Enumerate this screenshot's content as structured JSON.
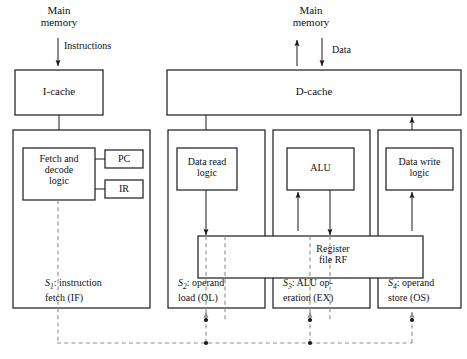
{
  "figure": {
    "type": "block-diagram"
  },
  "memory_ports": {
    "instruction_side": {
      "label": "Main\nmemory",
      "bus_label": "Instructions",
      "direction": "down"
    },
    "data_side": {
      "label": "Main\nmemory",
      "bus_label": "Data",
      "direction": "bidirectional"
    }
  },
  "caches": {
    "icache": "I-cache",
    "dcache": "D-cache"
  },
  "units": {
    "fetch_decode": "Fetch and\ndecode\nlogic",
    "pc": "PC",
    "ir": "IR",
    "data_read": "Data read\nlogic",
    "alu": "ALU",
    "data_write": "Data write\nlogic",
    "register_file": "Register\nfile RF"
  },
  "stages": [
    {
      "id": "S1",
      "sub": "1",
      "name": "instruction",
      "name2": "fetch (IF)"
    },
    {
      "id": "S2",
      "sub": "2",
      "name": "operand",
      "name2": "load (OL)"
    },
    {
      "id": "S3",
      "sub": "3",
      "name": "ALU op-",
      "name2": "eration (EX)"
    },
    {
      "id": "S4",
      "sub": "4",
      "name": "operand",
      "name2": "store (OS)"
    }
  ],
  "colors": {
    "line": "#1a1a1a",
    "dashed": "#8e8e8e",
    "background": "#ffffff"
  }
}
